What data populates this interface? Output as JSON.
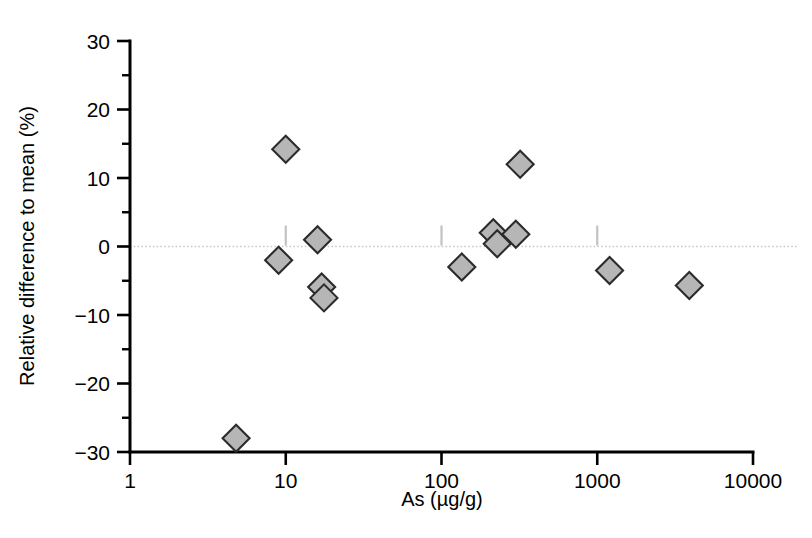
{
  "chart_data": {
    "type": "scatter",
    "title": "",
    "xlabel": "As (µg/g)",
    "ylabel": "Relative difference to mean (%)",
    "xscale": "log",
    "yscale": "linear",
    "xlim": [
      1,
      10000
    ],
    "ylim": [
      -30,
      30
    ],
    "grid": false,
    "legend": null,
    "x_tick_labels": [
      "1",
      "10",
      "100",
      "1000",
      "10000"
    ],
    "x_tick_values": [
      1,
      10,
      100,
      1000,
      10000
    ],
    "y_tick_labels": [
      "30",
      "20",
      "10",
      "0",
      "−10",
      "−20",
      "−30"
    ],
    "y_tick_values": [
      30,
      20,
      10,
      0,
      -10,
      -20,
      -30
    ],
    "y_minor_tick_values": [
      25,
      15,
      5,
      -5,
      -15,
      -25
    ],
    "reference_line_y": 0,
    "marker": "diamond",
    "marker_fill": "#b6b6b6",
    "marker_edge": "#2b2b2b",
    "points": [
      {
        "x": 4.8,
        "y": -28.0
      },
      {
        "x": 9.0,
        "y": -2.0
      },
      {
        "x": 10.0,
        "y": 14.2
      },
      {
        "x": 16.0,
        "y": 1.0
      },
      {
        "x": 17.0,
        "y": -5.9
      },
      {
        "x": 17.6,
        "y": -7.5
      },
      {
        "x": 135.0,
        "y": -3.0
      },
      {
        "x": 215.0,
        "y": 2.0
      },
      {
        "x": 228.0,
        "y": 0.4
      },
      {
        "x": 300.0,
        "y": 1.8
      },
      {
        "x": 320.0,
        "y": 12.0
      },
      {
        "x": 1200.0,
        "y": -3.5
      },
      {
        "x": 3900.0,
        "y": -5.7
      }
    ]
  },
  "axes": {
    "x_title": "As (µg/g)",
    "y_title": "Relative difference to mean (%)"
  }
}
